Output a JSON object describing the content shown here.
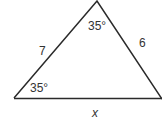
{
  "diagram": {
    "type": "triangle",
    "colors": {
      "stroke": "#2a2a2a",
      "text": "#333333",
      "background": "#ffffff"
    },
    "vertices": {
      "apex": {
        "x": 97,
        "y": 1
      },
      "bottom_left": {
        "x": 14,
        "y": 98
      },
      "bottom_right": {
        "x": 162,
        "y": 99
      }
    },
    "angles": {
      "apex": "35°",
      "bottom_left": "35°"
    },
    "sides": {
      "left": "7",
      "right": "6",
      "bottom": "x"
    }
  }
}
